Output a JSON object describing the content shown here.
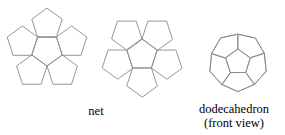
{
  "figure": {
    "stroke_color": "#8a8a8a",
    "background_color": "#ffffff",
    "text_color": "#000000",
    "captions": {
      "net": "net",
      "dodecahedron_line1": "dodecahedron",
      "dodecahedron_line2": "(front view)"
    }
  },
  "chart_data": {
    "type": "diagram",
    "shapes": [
      {
        "name": "net-left-flower",
        "description": "Central regular pentagon (apex pointing down) surrounded by five regular pentagons sharing each edge",
        "center": [
          47,
          50
        ],
        "circumradius": 16,
        "central_rotation_deg": 36,
        "petal_count": 5
      },
      {
        "name": "net-right-flower",
        "description": "Central regular pentagon (apex pointing up) surrounded by five regular pentagons sharing each edge, mirror of the left flower",
        "center": [
          142,
          55
        ],
        "circumradius": 16,
        "central_rotation_deg": 0,
        "petal_count": 5
      },
      {
        "name": "dodecahedron-front-view",
        "description": "Front-view projection of a regular dodecahedron: central pentagon, five surrounding foreshortened pentagons, decagonal outer silhouette",
        "center": [
          238,
          62
        ],
        "outer_radius": 31,
        "inner_radius": 13,
        "faces_visible": 6,
        "total_faces": 12
      }
    ],
    "labels": [
      {
        "text": "net",
        "x": 96,
        "y": 112
      },
      {
        "text": "dodecahedron",
        "x": 234,
        "y": 110
      },
      {
        "text": "(front view)",
        "x": 234,
        "y": 124
      }
    ]
  }
}
